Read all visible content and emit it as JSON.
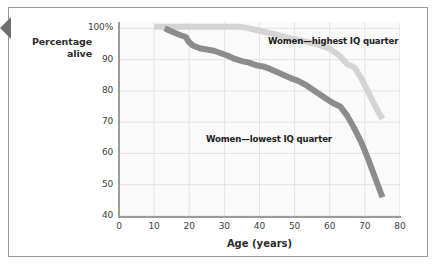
{
  "figure": {
    "background_color": "#ffffff",
    "frame_color": "#9a9a9a",
    "edge_tab_color": "#6f6f6f"
  },
  "axis_titles": {
    "y_line1": "Percentage",
    "y_line2": "alive",
    "x": "Age (years)"
  },
  "chart_data": {
    "type": "line",
    "title": "",
    "subtitle": "",
    "xlabel": "Age (years)",
    "ylabel": "Percentage alive",
    "xlim": [
      0,
      80
    ],
    "ylim": [
      40,
      102
    ],
    "xticks": [
      "0",
      "10",
      "20",
      "30",
      "40",
      "50",
      "60",
      "70",
      "80"
    ],
    "xtick_values": [
      0,
      10,
      20,
      30,
      40,
      50,
      60,
      70,
      80
    ],
    "yticks": [
      "40",
      "50",
      "60",
      "70",
      "80",
      "90",
      "100%"
    ],
    "ytick_values": [
      40,
      50,
      60,
      70,
      80,
      90,
      100
    ],
    "grid": true,
    "grid_color": "#e3e3e3",
    "plot_background": "#fafafa",
    "legend_position": "inline-annotations",
    "annotations": [
      {
        "text": "Women—highest IQ quarter",
        "x": 47,
        "y": 98,
        "series": "highest"
      },
      {
        "text": "Women—lowest IQ quarter",
        "x": 32,
        "y": 69,
        "series": "lowest"
      }
    ],
    "series": [
      {
        "name": "Women—highest IQ quarter",
        "color": "#d4d4d4",
        "linewidth": 6,
        "x": [
          10,
          14,
          18,
          22,
          26,
          30,
          34,
          36,
          40,
          44,
          48,
          52,
          56,
          60,
          63,
          65,
          67,
          69,
          71,
          73,
          75
        ],
        "values": [
          100.5,
          100.5,
          100.5,
          100.5,
          100.5,
          100.5,
          100.5,
          100.2,
          99.2,
          98.2,
          97.0,
          96.0,
          95.0,
          93.5,
          91.0,
          88.5,
          87.5,
          84.0,
          79.5,
          75.0,
          71.0
        ]
      },
      {
        "name": "Women—lowest IQ quarter",
        "color": "#8c8c8c",
        "linewidth": 6,
        "x": [
          13,
          15,
          17,
          19,
          20,
          21,
          23,
          25,
          27,
          29,
          31,
          33,
          35,
          37,
          39,
          41,
          43,
          45,
          47,
          49,
          51,
          53,
          55,
          57,
          59,
          61,
          63,
          65,
          67,
          69,
          71,
          73,
          75
        ],
        "values": [
          100.0,
          99.0,
          98.0,
          97.2,
          95.5,
          94.5,
          93.6,
          93.2,
          92.8,
          92.0,
          91.2,
          90.2,
          89.5,
          89.0,
          88.2,
          87.8,
          87.0,
          86.0,
          85.0,
          84.0,
          83.2,
          82.0,
          80.5,
          79.0,
          77.5,
          76.0,
          75.0,
          72.0,
          68.0,
          63.5,
          58.0,
          52.0,
          46.0
        ]
      }
    ]
  }
}
